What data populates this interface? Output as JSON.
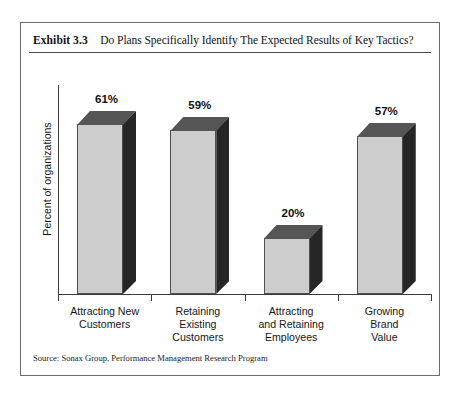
{
  "exhibit": {
    "number": "Exhibit 3.3",
    "title": "Do Plans Specifically Identify The Expected Results of Key Tactics?",
    "source": "Source: Sonax Group, Performance Management Research Program"
  },
  "chart_data": {
    "type": "bar",
    "title": "Do Plans Specifically Identify The Expected Results of Key Tactics?",
    "xlabel": "",
    "ylabel": "Percent of organizations",
    "ylim": [
      0,
      70
    ],
    "grid": false,
    "legend": "none",
    "categories": [
      "Attracting New Customers",
      "Retaining Existing Customers",
      "Attracting and Retaining Employees",
      "Growing Brand Value"
    ],
    "category_lines": [
      [
        "Attracting New",
        "Customers"
      ],
      [
        "Retaining",
        "Existing",
        "Customers"
      ],
      [
        "Attracting",
        "and Retaining",
        "Employees"
      ],
      [
        "Growing",
        "Brand",
        "Value"
      ]
    ],
    "values": [
      61,
      59,
      20,
      57
    ],
    "value_labels": [
      "61%",
      "59%",
      "20%",
      "57%"
    ],
    "colors": {
      "bar_front": "#cdcdcd",
      "bar_side": "#262626",
      "bar_top": "#555555",
      "axis": "#3a3a3a",
      "frame": "#6d6d6d",
      "text": "#161616"
    }
  }
}
